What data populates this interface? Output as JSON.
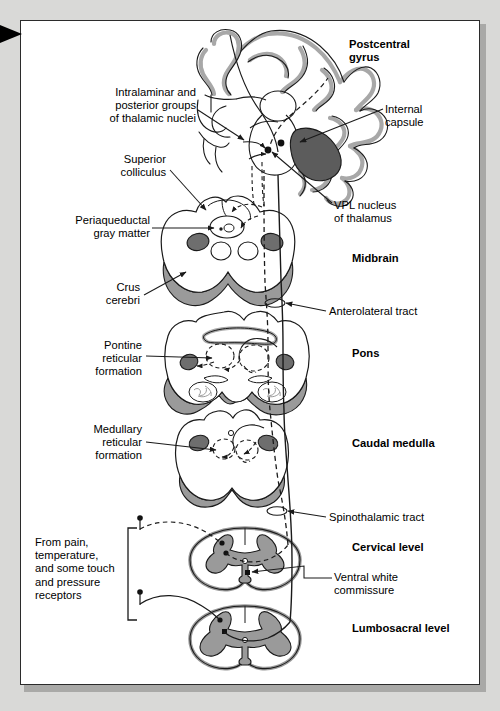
{
  "figure": {
    "panel_bg": "#ffffff",
    "page_bg": "#d9d9d7",
    "ink": "#1a1a1a",
    "gray_fill": "#9a9a9a",
    "dark_fill": "#6e6e6e",
    "darkest_fill": "#4a4a4a",
    "cortex_band": "#a8a8a8"
  },
  "edge_marker": {
    "icon": "right-triangle-marker"
  },
  "structure_labels": [
    {
      "id": "postcentral-gyrus",
      "text": "Postcentral\ngyrus",
      "bold": true,
      "align": "left",
      "x": 349,
      "y": 38
    },
    {
      "id": "internal-capsule",
      "text": "Internal\ncapsule",
      "bold": false,
      "align": "left",
      "x": 385,
      "y": 103
    },
    {
      "id": "vpl-nucleus",
      "text": "VPL nucleus\nof thalamus",
      "bold": false,
      "align": "left",
      "x": 334,
      "y": 206
    },
    {
      "id": "midbrain",
      "text": "Midbrain",
      "bold": true,
      "align": "left",
      "x": 352,
      "y": 252
    },
    {
      "id": "anterolateral-tract",
      "text": "Anterolateral tract",
      "bold": false,
      "align": "left",
      "x": 329,
      "y": 309
    },
    {
      "id": "pons",
      "text": "Pons",
      "bold": true,
      "align": "left",
      "x": 352,
      "y": 347
    },
    {
      "id": "caudal-medulla",
      "text": "Caudal medulla",
      "bold": true,
      "align": "left",
      "x": 352,
      "y": 446
    },
    {
      "id": "spinothalamic-tract",
      "text": "Spinothalamic tract",
      "bold": false,
      "align": "left",
      "x": 329,
      "y": 515
    },
    {
      "id": "cervical-level",
      "text": "Cervical level",
      "bold": true,
      "align": "left",
      "x": 352,
      "y": 546
    },
    {
      "id": "ventral-white-commissure",
      "text": "Ventral white\ncommissure",
      "bold": false,
      "align": "left",
      "x": 334,
      "y": 581
    },
    {
      "id": "lumbosacral-level",
      "text": "Lumbosacral level",
      "bold": true,
      "align": "left",
      "x": 352,
      "y": 627
    },
    {
      "id": "intralaminar-posterior",
      "text": "Intralaminar and\nposterior groups\nof thalamic nuclei",
      "bold": false,
      "align": "right",
      "x": 77,
      "y": 88
    },
    {
      "id": "superior-colliculus",
      "text": "Superior\ncolliculus",
      "bold": false,
      "align": "right",
      "x": 85,
      "y": 155
    },
    {
      "id": "periaqueductal-gray",
      "text": "Periaqueductal\ngray matter",
      "bold": false,
      "align": "right",
      "x": 62,
      "y": 218
    },
    {
      "id": "crus-cerebri",
      "text": "Crus\ncerebri",
      "bold": false,
      "align": "right",
      "x": 91,
      "y": 283
    },
    {
      "id": "pontine-reticular-formation",
      "text": "Pontine\nreticular\nformation",
      "bold": false,
      "align": "right",
      "x": 78,
      "y": 341
    },
    {
      "id": "medullary-reticular-formation",
      "text": "Medullary\nreticular\nformation",
      "bold": false,
      "align": "right",
      "x": 75,
      "y": 425
    },
    {
      "id": "receptor-source",
      "text": "From pain,\ntemperature,\nand some touch\nand pressure\nreceptors",
      "bold": false,
      "align": "left",
      "x": 35,
      "y": 538
    }
  ],
  "sections": [
    {
      "id": "cerebrum",
      "name": "Cerebral hemisphere with thalamus",
      "center_x": 280,
      "center_y": 120
    },
    {
      "id": "midbrain-section",
      "name": "Midbrain cross-section",
      "center_x": 240,
      "center_y": 250
    },
    {
      "id": "pons-section",
      "name": "Pons cross-section",
      "center_x": 240,
      "center_y": 362
    },
    {
      "id": "medulla-section",
      "name": "Caudal medulla cross-section",
      "center_x": 240,
      "center_y": 460
    },
    {
      "id": "cervical-section",
      "name": "Cervical spinal cord cross-section",
      "center_x": 245,
      "center_y": 558
    },
    {
      "id": "lumbosacral-section",
      "name": "Lumbosacral spinal cord cross-section",
      "center_x": 245,
      "center_y": 637
    }
  ],
  "pathway": {
    "solid_tract_name": "Spinothalamic / anterolateral tract (direct)",
    "dashed_tract_name": "Spinoreticular / spinomesencephalic collaterals"
  }
}
